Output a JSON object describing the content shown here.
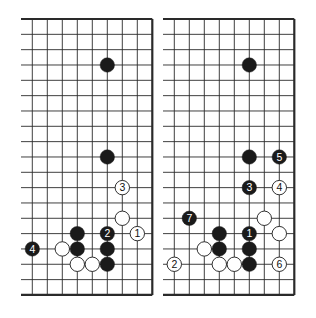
{
  "figure": {
    "colors": {
      "black": "#1a1a1a",
      "white": "#ffffff",
      "line": "#2a2a2a",
      "background": "#ffffff"
    }
  },
  "boards": [
    {
      "id": "left",
      "stones": [
        {
          "color": "black",
          "col": 3,
          "row": 3,
          "label": ""
        },
        {
          "color": "black",
          "col": 3,
          "row": 9,
          "label": ""
        },
        {
          "color": "white",
          "col": 2,
          "row": 11,
          "label": "3"
        },
        {
          "color": "white",
          "col": 2,
          "row": 13,
          "label": ""
        },
        {
          "color": "white",
          "col": 1,
          "row": 14,
          "label": "1"
        },
        {
          "color": "black",
          "col": 3,
          "row": 14,
          "label": "2"
        },
        {
          "color": "black",
          "col": 5,
          "row": 14,
          "label": ""
        },
        {
          "color": "black",
          "col": 8,
          "row": 15,
          "label": "4"
        },
        {
          "color": "white",
          "col": 6,
          "row": 15,
          "label": ""
        },
        {
          "color": "black",
          "col": 5,
          "row": 15,
          "label": ""
        },
        {
          "color": "black",
          "col": 3,
          "row": 15,
          "label": ""
        },
        {
          "color": "white",
          "col": 5,
          "row": 16,
          "label": ""
        },
        {
          "color": "white",
          "col": 4,
          "row": 16,
          "label": ""
        },
        {
          "color": "black",
          "col": 3,
          "row": 16,
          "label": ""
        }
      ]
    },
    {
      "id": "right",
      "stones": [
        {
          "color": "black",
          "col": 3,
          "row": 3,
          "label": ""
        },
        {
          "color": "black",
          "col": 3,
          "row": 9,
          "label": ""
        },
        {
          "color": "black",
          "col": 1,
          "row": 9,
          "label": "5"
        },
        {
          "color": "black",
          "col": 3,
          "row": 11,
          "label": "3"
        },
        {
          "color": "white",
          "col": 1,
          "row": 11,
          "label": "4"
        },
        {
          "color": "black",
          "col": 7,
          "row": 13,
          "label": "7"
        },
        {
          "color": "white",
          "col": 2,
          "row": 13,
          "label": ""
        },
        {
          "color": "black",
          "col": 5,
          "row": 14,
          "label": ""
        },
        {
          "color": "black",
          "col": 3,
          "row": 14,
          "label": "1"
        },
        {
          "color": "white",
          "col": 1,
          "row": 14,
          "label": ""
        },
        {
          "color": "white",
          "col": 6,
          "row": 15,
          "label": ""
        },
        {
          "color": "black",
          "col": 5,
          "row": 15,
          "label": ""
        },
        {
          "color": "black",
          "col": 3,
          "row": 15,
          "label": ""
        },
        {
          "color": "white",
          "col": 8,
          "row": 16,
          "label": "2"
        },
        {
          "color": "white",
          "col": 5,
          "row": 16,
          "label": ""
        },
        {
          "color": "white",
          "col": 4,
          "row": 16,
          "label": ""
        },
        {
          "color": "black",
          "col": 3,
          "row": 16,
          "label": ""
        },
        {
          "color": "white",
          "col": 1,
          "row": 16,
          "label": "6"
        }
      ]
    }
  ]
}
